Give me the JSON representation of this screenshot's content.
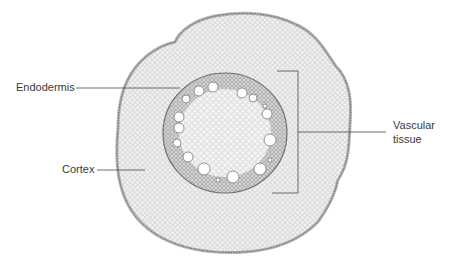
{
  "figure": {
    "labels": {
      "endodermis": "Endodermis",
      "cortex": "Cortex",
      "vascular_line1": "Vascular",
      "vascular_line2": "tissue"
    },
    "colors": {
      "background": "#ffffff",
      "tissue_fill": "#ececec",
      "outer_edge": "#7a7a7a",
      "vascular_ring": "#9a9a9a",
      "pointer_lines": "#4a4a4a",
      "label_text": "#3a3a3a"
    },
    "vessels": [
      {
        "cx": 199,
        "cy": 91,
        "r": 5
      },
      {
        "cx": 213,
        "cy": 87,
        "r": 5
      },
      {
        "cx": 186,
        "cy": 99,
        "r": 4
      },
      {
        "cx": 242,
        "cy": 93,
        "r": 5
      },
      {
        "cx": 253,
        "cy": 98,
        "r": 4
      },
      {
        "cx": 265,
        "cy": 106,
        "r": 2
      },
      {
        "cx": 267,
        "cy": 114,
        "r": 5
      },
      {
        "cx": 179,
        "cy": 117,
        "r": 5
      },
      {
        "cx": 179,
        "cy": 128,
        "r": 5
      },
      {
        "cx": 177,
        "cy": 143,
        "r": 4
      },
      {
        "cx": 270,
        "cy": 140,
        "r": 6
      },
      {
        "cx": 188,
        "cy": 157,
        "r": 5
      },
      {
        "cx": 204,
        "cy": 169,
        "r": 6
      },
      {
        "cx": 218,
        "cy": 180,
        "r": 2
      },
      {
        "cx": 233,
        "cy": 177,
        "r": 6
      },
      {
        "cx": 260,
        "cy": 169,
        "r": 6
      },
      {
        "cx": 270,
        "cy": 160,
        "r": 2
      }
    ]
  }
}
